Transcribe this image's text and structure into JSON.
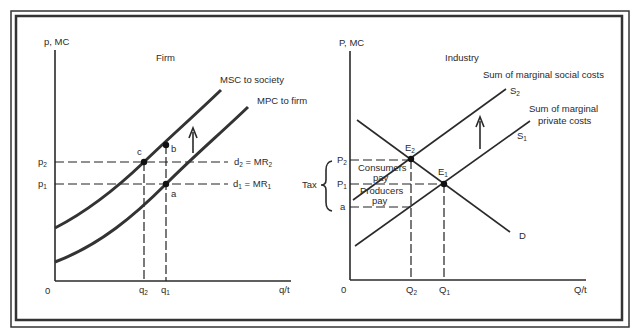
{
  "colors": {
    "ink": "#2a2a2a",
    "background": "#ffffff"
  },
  "firm": {
    "title": "Firm",
    "y_axis_label": "p, MC",
    "x_axis_label": "q/t",
    "origin": "0",
    "curves": {
      "msc": "MSC to society",
      "mpc": "MPC to firm"
    },
    "price_levels": {
      "p2": "p",
      "p2_sub": "2",
      "p1": "p",
      "p1_sub": "1"
    },
    "quantities": {
      "q2": "q",
      "q2_sub": "2",
      "q1": "q",
      "q1_sub": "1"
    },
    "demand_lines": {
      "d2": "d",
      "d2_sub": "2",
      "d2_eq": " = MR",
      "d2_eq_sub": "2",
      "d1": "d",
      "d1_sub": "1",
      "d1_eq": " = MR",
      "d1_eq_sub": "1"
    },
    "points": {
      "a": "a",
      "b": "b",
      "c": "c"
    }
  },
  "industry": {
    "title": "Industry",
    "y_axis_label": "P, MC",
    "x_axis_label": "Q/t",
    "origin": "0",
    "curves": {
      "social": "Sum of marginal social costs",
      "private_line1": "Sum of marginal",
      "private_line2": "private costs",
      "s2": "S",
      "s2_sub": "2",
      "s1": "S",
      "s1_sub": "1",
      "demand": "D"
    },
    "price_levels": {
      "p2": "P",
      "p2_sub": "2",
      "p1": "P",
      "p1_sub": "1",
      "a": "a"
    },
    "quantities": {
      "q2": "Q",
      "q2_sub": "2",
      "q1": "Q",
      "q1_sub": "1"
    },
    "equilibria": {
      "e2": "E",
      "e2_sub": "2",
      "e1": "E",
      "e1_sub": "1"
    },
    "tax": {
      "label": "Tax",
      "consumers_line1": "Consumers",
      "consumers_line2": "pay",
      "producers_line1": "Producers",
      "producers_line2": "pay"
    }
  }
}
